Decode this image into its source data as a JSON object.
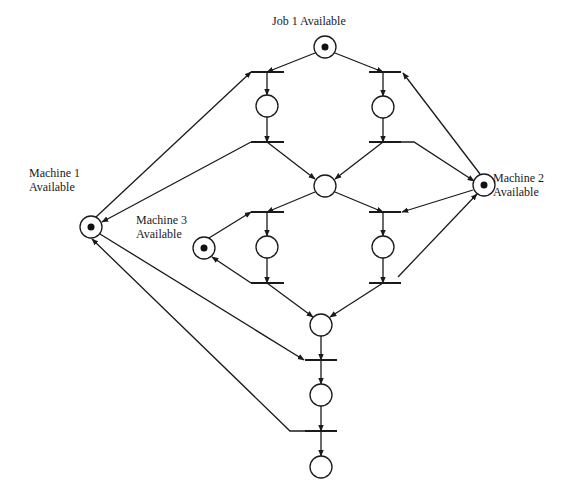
{
  "diagram": {
    "type": "petri-net",
    "labels": [
      {
        "id": "job1",
        "lines": [
          "Job 1 Available"
        ],
        "x": 272,
        "y": 14
      },
      {
        "id": "machine1",
        "lines": [
          "Machine 1",
          "Available"
        ],
        "x": 29,
        "y": 166
      },
      {
        "id": "machine2",
        "lines": [
          "Machine 2",
          "Available"
        ],
        "x": 493,
        "y": 171
      },
      {
        "id": "machine3",
        "lines": [
          "Machine 3",
          "Available"
        ],
        "x": 136,
        "y": 213
      }
    ],
    "places": [
      {
        "id": "p_job1",
        "cx": 325,
        "cy": 47,
        "token": true,
        "name": "job-1-available-place"
      },
      {
        "id": "p_m1",
        "cx": 91,
        "cy": 227,
        "token": true,
        "name": "machine-1-available-place"
      },
      {
        "id": "p_m2",
        "cx": 484,
        "cy": 185,
        "token": true,
        "name": "machine-2-available-place"
      },
      {
        "id": "p_m3",
        "cx": 204,
        "cy": 248,
        "token": true,
        "name": "machine-3-available-place"
      },
      {
        "id": "p_a1",
        "cx": 267,
        "cy": 106,
        "token": false,
        "name": "op1-on-m1-place"
      },
      {
        "id": "p_a2",
        "cx": 383,
        "cy": 107,
        "token": false,
        "name": "op1-on-m2-place"
      },
      {
        "id": "p_mid",
        "cx": 325,
        "cy": 186,
        "token": false,
        "name": "op1-done-place"
      },
      {
        "id": "p_b1",
        "cx": 267,
        "cy": 247,
        "token": false,
        "name": "op2-on-m3-place"
      },
      {
        "id": "p_b2",
        "cx": 383,
        "cy": 247,
        "token": false,
        "name": "op2-on-m2-place"
      },
      {
        "id": "p_c",
        "cx": 321,
        "cy": 325,
        "token": false,
        "name": "op2-done-place"
      },
      {
        "id": "p_d",
        "cx": 321,
        "cy": 395,
        "token": false,
        "name": "op3-on-m1-place"
      },
      {
        "id": "p_end",
        "cx": 321,
        "cy": 467,
        "token": false,
        "name": "job-complete-place"
      }
    ],
    "place_radius": 11,
    "token_radius": 3.5,
    "transitions": [
      {
        "id": "t1",
        "x1": 251,
        "x2": 284,
        "y": 72
      },
      {
        "id": "t2",
        "x1": 369,
        "x2": 401,
        "y": 72
      },
      {
        "id": "t3",
        "x1": 251,
        "x2": 284,
        "y": 142
      },
      {
        "id": "t4",
        "x1": 369,
        "x2": 401,
        "y": 142
      },
      {
        "id": "t5",
        "x1": 251,
        "x2": 284,
        "y": 212
      },
      {
        "id": "t6",
        "x1": 369,
        "x2": 401,
        "y": 212
      },
      {
        "id": "t7",
        "x1": 251,
        "x2": 284,
        "y": 283
      },
      {
        "id": "t8",
        "x1": 369,
        "x2": 401,
        "y": 283
      },
      {
        "id": "t9",
        "x1": 305,
        "x2": 337,
        "y": 360
      },
      {
        "id": "t10",
        "x1": 305,
        "x2": 337,
        "y": 431
      }
    ],
    "arcs": [
      {
        "from": "p_job1",
        "to": "t1",
        "points": [
          [
            315,
            53
          ],
          [
            267,
            72
          ]
        ]
      },
      {
        "from": "p_job1",
        "to": "t2",
        "points": [
          [
            335,
            53
          ],
          [
            383,
            72
          ]
        ]
      },
      {
        "from": "t1",
        "to": "p_a1",
        "points": [
          [
            267,
            72
          ],
          [
            267,
            95
          ]
        ]
      },
      {
        "from": "t2",
        "to": "p_a2",
        "points": [
          [
            383,
            72
          ],
          [
            383,
            96
          ]
        ]
      },
      {
        "from": "p_a1",
        "to": "t3",
        "points": [
          [
            267,
            117
          ],
          [
            267,
            142
          ]
        ]
      },
      {
        "from": "p_a2",
        "to": "t4",
        "points": [
          [
            383,
            118
          ],
          [
            383,
            142
          ]
        ]
      },
      {
        "from": "p_m1",
        "to": "t1",
        "points": [
          [
            96,
            217
          ],
          [
            251,
            72
          ]
        ]
      },
      {
        "from": "t3",
        "to": "p_m1",
        "points": [
          [
            251,
            142
          ],
          [
            102,
            222
          ]
        ]
      },
      {
        "from": "p_m2",
        "to": "t2",
        "points": [
          [
            480,
            174
          ],
          [
            403,
            73
          ]
        ]
      },
      {
        "from": "t4",
        "to": "p_m2",
        "points": [
          [
            401,
            142
          ],
          [
            414,
            142
          ],
          [
            474,
            181
          ]
        ]
      },
      {
        "from": "t3",
        "to": "p_mid",
        "points": [
          [
            267,
            142
          ],
          [
            315,
            179
          ]
        ]
      },
      {
        "from": "t4",
        "to": "p_mid",
        "points": [
          [
            383,
            142
          ],
          [
            335,
            179
          ]
        ]
      },
      {
        "from": "p_mid",
        "to": "t5",
        "points": [
          [
            315,
            192
          ],
          [
            267,
            212
          ]
        ]
      },
      {
        "from": "p_mid",
        "to": "t6",
        "points": [
          [
            335,
            192
          ],
          [
            383,
            212
          ]
        ]
      },
      {
        "from": "p_m3",
        "to": "t5",
        "points": [
          [
            209,
            238
          ],
          [
            251,
            212
          ]
        ]
      },
      {
        "from": "t7",
        "to": "p_m3",
        "points": [
          [
            251,
            283
          ],
          [
            212,
            257
          ]
        ]
      },
      {
        "from": "p_m2",
        "to": "t6",
        "points": [
          [
            473,
            190
          ],
          [
            402,
            212
          ]
        ]
      },
      {
        "from": "t8",
        "to": "p_m2",
        "points": [
          [
            398,
            277
          ],
          [
            477,
            194
          ]
        ]
      },
      {
        "from": "t5",
        "to": "p_b1",
        "points": [
          [
            267,
            212
          ],
          [
            267,
            236
          ]
        ]
      },
      {
        "from": "t6",
        "to": "p_b2",
        "points": [
          [
            383,
            212
          ],
          [
            383,
            236
          ]
        ]
      },
      {
        "from": "p_b1",
        "to": "t7",
        "points": [
          [
            267,
            258
          ],
          [
            267,
            283
          ]
        ]
      },
      {
        "from": "p_b2",
        "to": "t8",
        "points": [
          [
            383,
            258
          ],
          [
            383,
            283
          ]
        ]
      },
      {
        "from": "t7",
        "to": "p_c",
        "points": [
          [
            267,
            283
          ],
          [
            313,
            317
          ]
        ]
      },
      {
        "from": "t8",
        "to": "p_c",
        "points": [
          [
            383,
            283
          ],
          [
            330,
            317
          ]
        ]
      },
      {
        "from": "p_c",
        "to": "t9",
        "points": [
          [
            321,
            336
          ],
          [
            321,
            360
          ]
        ]
      },
      {
        "from": "p_m1",
        "to": "t9",
        "points": [
          [
            100,
            234
          ],
          [
            304,
            360
          ]
        ]
      },
      {
        "from": "t9",
        "to": "p_d",
        "points": [
          [
            321,
            360
          ],
          [
            321,
            384
          ]
        ]
      },
      {
        "from": "p_d",
        "to": "t10",
        "points": [
          [
            321,
            406
          ],
          [
            321,
            431
          ]
        ]
      },
      {
        "from": "t10",
        "to": "p_m1",
        "points": [
          [
            305,
            431
          ],
          [
            290,
            431
          ],
          [
            92,
            239
          ]
        ]
      },
      {
        "from": "t10",
        "to": "p_end",
        "points": [
          [
            321,
            431
          ],
          [
            321,
            456
          ]
        ]
      }
    ],
    "colors": {
      "stroke": "#1a1a1a",
      "token": "#111111",
      "background": "#ffffff"
    }
  }
}
